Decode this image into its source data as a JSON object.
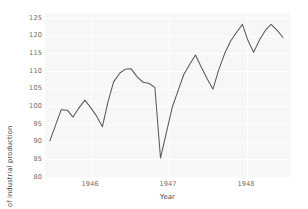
{
  "chart_data": {
    "type": "line",
    "title": "",
    "xlabel": "Year",
    "ylabel": "Index of industrial production",
    "xlim": [
      1945.35,
      1948.85
    ],
    "ylim": [
      79.0,
      126.6
    ],
    "yticks": [
      80,
      85,
      90,
      95,
      100,
      105,
      110,
      115,
      120,
      125
    ],
    "xticks": [
      1946,
      1947,
      1948
    ],
    "xtick_labels": [
      "1946",
      "1947",
      "1948"
    ],
    "grid": true,
    "legend": null,
    "series": [
      {
        "name": "Index of industrial production",
        "color": "#5a5a5a",
        "x": [
          1945.42,
          1945.5,
          1945.58,
          1945.67,
          1945.75,
          1945.83,
          1945.92,
          1946.0,
          1946.08,
          1946.17,
          1946.25,
          1946.33,
          1946.42,
          1946.5,
          1946.58,
          1946.67,
          1946.75,
          1946.83,
          1946.92,
          1947.0,
          1947.08,
          1947.17,
          1947.25,
          1947.33,
          1947.42,
          1947.5,
          1947.58,
          1947.67,
          1947.75,
          1947.83,
          1947.92,
          1948.0,
          1948.08,
          1948.17,
          1948.25,
          1948.33,
          1948.42,
          1948.5,
          1948.58,
          1948.67,
          1948.75
        ],
        "y": [
          89.5,
          94.0,
          98.5,
          98.4,
          96.4,
          98.9,
          101.3,
          99.2,
          96.9,
          93.6,
          100.8,
          106.6,
          109.2,
          110.3,
          110.4,
          108.0,
          106.5,
          106.2,
          105.0,
          84.5,
          91.5,
          99.4,
          104.0,
          108.6,
          111.8,
          114.4,
          111.0,
          107.4,
          104.5,
          110.0,
          115.0,
          118.4,
          120.8,
          123.3,
          118.6,
          115.2,
          119.0,
          121.6,
          123.3,
          121.5,
          119.5
        ]
      }
    ]
  },
  "axes": {
    "ylabel": "Index of industrial production",
    "xlabel": "Year",
    "ytick_labels": [
      "125",
      "120",
      "115",
      "110",
      "105",
      "100",
      "95",
      "90",
      "85",
      "80"
    ],
    "xtick_labels": [
      "1946",
      "1947",
      "1948"
    ]
  },
  "style": {
    "plot_background": "#f7f7f7",
    "figure_background": "#ffffff",
    "gridline_color": "#ffffff",
    "line_color": "#5a5a5a",
    "tick_label_color": "#6e6e6e",
    "axis_label_color": "#4a4a4a"
  }
}
